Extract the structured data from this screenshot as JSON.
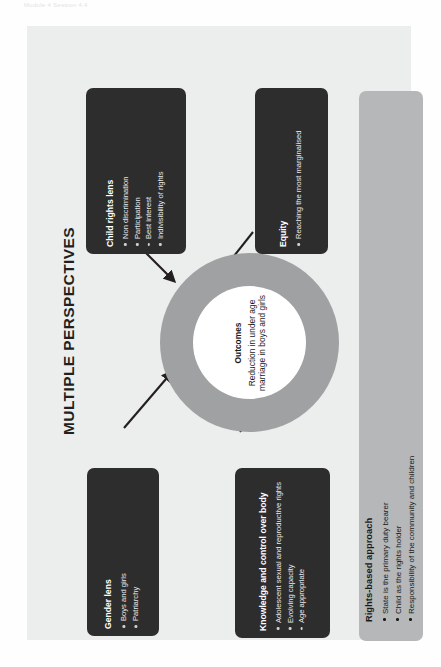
{
  "page": {
    "top_crumb": "Module 4 Session 4.4",
    "title": "MULTIPLE PERSPECTIVES",
    "panel_bg": "#eceded",
    "card_dark_bg": "#2d2d2d",
    "card_light_bg": "#b5b7b8",
    "ring_color": "#9fa1a2",
    "core_color": "#ffffff"
  },
  "center": {
    "heading": "Outcomes",
    "body": "Reduction in under age marriage in boys and girls"
  },
  "cards": [
    {
      "id": "child-rights",
      "title": "Child rights lens",
      "items": [
        "Non discrimination",
        "Participation",
        "Best interest",
        "Indivisibility of rights"
      ]
    },
    {
      "id": "equity",
      "title": "Equity",
      "items": [
        "Reaching the most marginalised"
      ]
    },
    {
      "id": "gender",
      "title": "Gender lens",
      "items": [
        "Boys and girls",
        "Patriarchy"
      ]
    },
    {
      "id": "knowledge",
      "title": "Knowledge and control over body",
      "items": [
        "Adolescent sexual and reproductive rights",
        "Evolving capacity",
        "Age appropriate"
      ]
    },
    {
      "id": "rights-based",
      "title": "Rights-based approach",
      "items": [
        "State is the primary duty bearer",
        "Child as the rights holder",
        "Responsibility of the community and children"
      ]
    }
  ]
}
